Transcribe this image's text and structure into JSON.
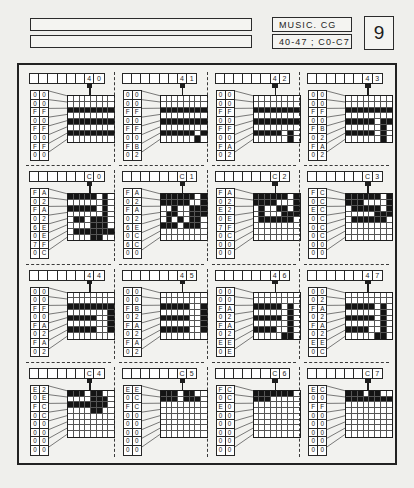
{
  "header": {
    "blank_field_1": "",
    "blank_field_2": "",
    "title": "MUSIC. CG",
    "range": "40-47 ; C0-C7",
    "page_number": "9"
  },
  "chart_data": {
    "type": "table",
    "title": "MUSIC. CG",
    "subtitle": "40-47 ; C0-C7",
    "columns": 4,
    "rows": 4,
    "cell_grid_size": "8x8",
    "codes": [
      "40",
      "41",
      "42",
      "43",
      "C0",
      "C1",
      "C2",
      "C3",
      "44",
      "45",
      "46",
      "47",
      "C4",
      "C5",
      "C6",
      "C7"
    ]
  },
  "cells": [
    {
      "code_hi": "4",
      "code_lo": "0",
      "bytes": [
        "00",
        "00",
        "FF",
        "00",
        "FF",
        "00",
        "FF",
        "00"
      ],
      "rows": [
        [
          0,
          0,
          0,
          0,
          0,
          0,
          0,
          0
        ],
        [
          0,
          0,
          0,
          0,
          0,
          0,
          0,
          0
        ],
        [
          1,
          1,
          1,
          1,
          1,
          1,
          1,
          1
        ],
        [
          0,
          0,
          0,
          0,
          0,
          0,
          0,
          0
        ],
        [
          1,
          1,
          1,
          1,
          1,
          1,
          1,
          1
        ],
        [
          0,
          0,
          0,
          0,
          0,
          0,
          0,
          0
        ],
        [
          1,
          1,
          1,
          1,
          1,
          1,
          1,
          1
        ],
        [
          0,
          0,
          0,
          0,
          0,
          0,
          0,
          0
        ]
      ]
    },
    {
      "code_hi": "4",
      "code_lo": "1",
      "bytes": [
        "00",
        "00",
        "FF",
        "00",
        "FF",
        "00",
        "FB",
        "02"
      ],
      "rows": [
        [
          0,
          0,
          0,
          0,
          0,
          0,
          0,
          0
        ],
        [
          0,
          0,
          0,
          0,
          0,
          0,
          0,
          0
        ],
        [
          1,
          1,
          1,
          1,
          1,
          1,
          1,
          1
        ],
        [
          0,
          0,
          0,
          0,
          0,
          0,
          0,
          0
        ],
        [
          1,
          1,
          1,
          1,
          1,
          1,
          1,
          1
        ],
        [
          0,
          0,
          0,
          0,
          0,
          0,
          0,
          0
        ],
        [
          1,
          1,
          1,
          1,
          1,
          1,
          0,
          1
        ],
        [
          0,
          0,
          0,
          0,
          0,
          0,
          1,
          0
        ]
      ]
    },
    {
      "code_hi": "4",
      "code_lo": "2",
      "bytes": [
        "00",
        "00",
        "FF",
        "00",
        "FF",
        "00",
        "FA",
        "02"
      ],
      "rows": [
        [
          0,
          0,
          0,
          0,
          0,
          0,
          0,
          0
        ],
        [
          0,
          0,
          0,
          0,
          0,
          0,
          0,
          0
        ],
        [
          1,
          1,
          1,
          1,
          1,
          1,
          1,
          1
        ],
        [
          0,
          0,
          0,
          0,
          0,
          0,
          0,
          0
        ],
        [
          1,
          1,
          1,
          1,
          1,
          1,
          1,
          1
        ],
        [
          0,
          0,
          0,
          0,
          0,
          0,
          0,
          0
        ],
        [
          1,
          1,
          1,
          1,
          1,
          0,
          1,
          0
        ],
        [
          0,
          0,
          0,
          0,
          0,
          0,
          1,
          0
        ]
      ]
    },
    {
      "code_hi": "4",
      "code_lo": "3",
      "bytes": [
        "00",
        "00",
        "FF",
        "00",
        "FB",
        "02",
        "FA",
        "02"
      ],
      "rows": [
        [
          0,
          0,
          0,
          0,
          0,
          0,
          0,
          0
        ],
        [
          0,
          0,
          0,
          0,
          0,
          0,
          0,
          0
        ],
        [
          1,
          1,
          1,
          1,
          1,
          1,
          1,
          1
        ],
        [
          0,
          0,
          0,
          0,
          0,
          0,
          0,
          0
        ],
        [
          1,
          1,
          1,
          1,
          1,
          0,
          1,
          1
        ],
        [
          0,
          0,
          0,
          0,
          0,
          0,
          1,
          0
        ],
        [
          1,
          1,
          1,
          1,
          1,
          0,
          1,
          0
        ],
        [
          0,
          0,
          0,
          0,
          0,
          0,
          1,
          0
        ]
      ]
    },
    {
      "code_hi": "C",
      "code_lo": "0",
      "bytes": [
        "FA",
        "02",
        "FA",
        "02",
        "6E",
        "0E",
        "7F",
        "0C"
      ],
      "rows": [
        [
          1,
          1,
          1,
          1,
          1,
          0,
          1,
          0
        ],
        [
          0,
          0,
          0,
          0,
          0,
          0,
          1,
          0
        ],
        [
          1,
          1,
          1,
          1,
          1,
          0,
          1,
          0
        ],
        [
          0,
          0,
          0,
          0,
          0,
          0,
          1,
          0
        ],
        [
          0,
          1,
          1,
          0,
          1,
          1,
          1,
          0
        ],
        [
          0,
          0,
          0,
          0,
          1,
          1,
          1,
          0
        ],
        [
          0,
          1,
          1,
          1,
          1,
          1,
          1,
          1
        ],
        [
          0,
          0,
          0,
          0,
          1,
          1,
          0,
          0
        ]
      ]
    },
    {
      "code_hi": "C",
      "code_lo": "1",
      "bytes": [
        "FA",
        "02",
        "FA",
        "02",
        "6E",
        "0C",
        "6C",
        "00"
      ],
      "rows": [
        [
          1,
          1,
          1,
          1,
          1,
          1,
          0,
          1
        ],
        [
          1,
          1,
          1,
          1,
          1,
          0,
          0,
          1
        ],
        [
          0,
          0,
          1,
          0,
          0,
          1,
          1,
          1
        ],
        [
          0,
          1,
          1,
          0,
          0,
          1,
          1,
          1
        ],
        [
          0,
          1,
          0,
          1,
          0,
          1,
          1,
          0
        ],
        [
          1,
          1,
          1,
          0,
          1,
          1,
          1,
          0
        ],
        [
          0,
          0,
          0,
          0,
          0,
          0,
          0,
          0
        ],
        [
          0,
          0,
          0,
          0,
          0,
          0,
          0,
          0
        ]
      ]
    },
    {
      "code_hi": "C",
      "code_lo": "2",
      "bytes": [
        "FA",
        "02",
        "E2",
        "0E",
        "7F",
        "0C",
        "00",
        "00"
      ],
      "rows": [
        [
          1,
          1,
          1,
          1,
          1,
          1,
          0,
          1
        ],
        [
          1,
          1,
          1,
          1,
          0,
          0,
          0,
          1
        ],
        [
          0,
          1,
          0,
          0,
          1,
          1,
          0,
          1
        ],
        [
          0,
          1,
          0,
          0,
          0,
          1,
          1,
          1
        ],
        [
          0,
          1,
          1,
          1,
          1,
          1,
          1,
          0
        ],
        [
          0,
          0,
          0,
          0,
          0,
          0,
          0,
          0
        ],
        [
          0,
          0,
          0,
          0,
          0,
          0,
          0,
          0
        ],
        [
          0,
          0,
          0,
          0,
          0,
          0,
          0,
          0
        ]
      ]
    },
    {
      "code_hi": "C",
      "code_lo": "3",
      "bytes": [
        "FC",
        "0C",
        "EC",
        "0C",
        "0C",
        "0C",
        "00",
        "00"
      ],
      "rows": [
        [
          1,
          1,
          1,
          1,
          1,
          1,
          0,
          1
        ],
        [
          1,
          1,
          1,
          0,
          0,
          0,
          0,
          1
        ],
        [
          0,
          1,
          1,
          1,
          1,
          1,
          0,
          1
        ],
        [
          0,
          0,
          0,
          0,
          0,
          1,
          1,
          1
        ],
        [
          0,
          1,
          1,
          1,
          1,
          1,
          1,
          0
        ],
        [
          0,
          0,
          0,
          0,
          0,
          0,
          0,
          0
        ],
        [
          0,
          0,
          0,
          0,
          0,
          0,
          0,
          0
        ],
        [
          0,
          0,
          0,
          0,
          0,
          0,
          0,
          0
        ]
      ]
    },
    {
      "code_hi": "4",
      "code_lo": "4",
      "bytes": [
        "00",
        "00",
        "FF",
        "00",
        "FA",
        "02",
        "FA",
        "02"
      ],
      "rows": [
        [
          0,
          0,
          0,
          0,
          0,
          0,
          0,
          0
        ],
        [
          0,
          0,
          0,
          0,
          0,
          0,
          0,
          0
        ],
        [
          1,
          1,
          1,
          1,
          1,
          1,
          1,
          1
        ],
        [
          0,
          0,
          0,
          0,
          0,
          0,
          0,
          1
        ],
        [
          1,
          1,
          1,
          1,
          1,
          0,
          0,
          1
        ],
        [
          0,
          0,
          0,
          0,
          0,
          0,
          0,
          1
        ],
        [
          1,
          1,
          1,
          1,
          1,
          0,
          0,
          1
        ],
        [
          0,
          0,
          0,
          0,
          0,
          0,
          0,
          0
        ]
      ]
    },
    {
      "code_hi": "4",
      "code_lo": "5",
      "bytes": [
        "00",
        "00",
        "FB",
        "02",
        "FA",
        "02",
        "FA",
        "02"
      ],
      "rows": [
        [
          0,
          0,
          0,
          0,
          0,
          0,
          0,
          0
        ],
        [
          0,
          0,
          0,
          0,
          0,
          0,
          0,
          0
        ],
        [
          1,
          1,
          1,
          1,
          1,
          0,
          0,
          1
        ],
        [
          0,
          0,
          0,
          0,
          0,
          0,
          0,
          1
        ],
        [
          1,
          1,
          1,
          1,
          1,
          0,
          0,
          1
        ],
        [
          0,
          0,
          0,
          0,
          0,
          0,
          0,
          1
        ],
        [
          1,
          1,
          1,
          1,
          1,
          0,
          0,
          1
        ],
        [
          0,
          0,
          0,
          0,
          0,
          0,
          0,
          0
        ]
      ]
    },
    {
      "code_hi": "4",
      "code_lo": "6",
      "bytes": [
        "00",
        "00",
        "FA",
        "02",
        "FA",
        "02",
        "EE",
        "0E"
      ],
      "rows": [
        [
          0,
          0,
          0,
          0,
          0,
          0,
          0,
          0
        ],
        [
          0,
          0,
          0,
          0,
          0,
          0,
          0,
          0
        ],
        [
          1,
          1,
          1,
          1,
          1,
          0,
          1,
          0
        ],
        [
          0,
          0,
          0,
          0,
          0,
          0,
          1,
          0
        ],
        [
          1,
          1,
          1,
          1,
          1,
          0,
          1,
          0
        ],
        [
          0,
          0,
          0,
          0,
          0,
          0,
          1,
          0
        ],
        [
          1,
          1,
          1,
          1,
          0,
          0,
          1,
          0
        ],
        [
          0,
          0,
          0,
          0,
          0,
          1,
          1,
          0
        ]
      ]
    },
    {
      "code_hi": "4",
      "code_lo": "7",
      "bytes": [
        "00",
        "02",
        "FA",
        "02",
        "FA",
        "02",
        "EE",
        "0C"
      ],
      "rows": [
        [
          0,
          0,
          0,
          0,
          0,
          0,
          0,
          0
        ],
        [
          0,
          0,
          0,
          0,
          0,
          0,
          0,
          0
        ],
        [
          1,
          1,
          1,
          1,
          1,
          0,
          1,
          0
        ],
        [
          0,
          0,
          0,
          0,
          0,
          0,
          1,
          0
        ],
        [
          1,
          1,
          1,
          1,
          1,
          0,
          1,
          0
        ],
        [
          0,
          0,
          0,
          0,
          0,
          0,
          1,
          0
        ],
        [
          1,
          1,
          1,
          1,
          0,
          0,
          1,
          0
        ],
        [
          0,
          0,
          0,
          0,
          0,
          1,
          1,
          0
        ]
      ]
    },
    {
      "code_hi": "C",
      "code_lo": "4",
      "bytes": [
        "E2",
        "0E",
        "FC",
        "0C",
        "00",
        "00",
        "00",
        "00"
      ],
      "rows": [
        [
          1,
          1,
          1,
          0,
          1,
          1,
          0,
          0
        ],
        [
          0,
          0,
          0,
          0,
          1,
          1,
          1,
          0
        ],
        [
          1,
          1,
          1,
          1,
          1,
          1,
          1,
          0
        ],
        [
          0,
          0,
          0,
          0,
          1,
          1,
          0,
          0
        ],
        [
          0,
          0,
          0,
          0,
          0,
          0,
          0,
          0
        ],
        [
          0,
          0,
          0,
          0,
          0,
          0,
          0,
          0
        ],
        [
          0,
          0,
          0,
          0,
          0,
          0,
          0,
          0
        ],
        [
          0,
          0,
          0,
          0,
          0,
          0,
          0,
          0
        ]
      ]
    },
    {
      "code_hi": "C",
      "code_lo": "5",
      "bytes": [
        "EE",
        "0C",
        "FC",
        "00",
        "00",
        "00",
        "00",
        "00"
      ],
      "rows": [
        [
          1,
          1,
          1,
          0,
          1,
          1,
          0,
          0
        ],
        [
          1,
          1,
          1,
          0,
          1,
          1,
          1,
          0
        ],
        [
          0,
          0,
          0,
          0,
          0,
          0,
          0,
          0
        ],
        [
          0,
          0,
          0,
          0,
          0,
          0,
          0,
          0
        ],
        [
          0,
          0,
          0,
          0,
          0,
          0,
          0,
          0
        ],
        [
          0,
          0,
          0,
          0,
          0,
          0,
          0,
          0
        ],
        [
          0,
          0,
          0,
          0,
          0,
          0,
          0,
          0
        ],
        [
          0,
          0,
          0,
          0,
          0,
          0,
          0,
          0
        ]
      ]
    },
    {
      "code_hi": "C",
      "code_lo": "6",
      "bytes": [
        "FC",
        "0C",
        "E0",
        "00",
        "00",
        "00",
        "00",
        "00"
      ],
      "rows": [
        [
          1,
          1,
          1,
          1,
          1,
          1,
          1,
          0
        ],
        [
          1,
          1,
          1,
          0,
          0,
          0,
          0,
          0
        ],
        [
          0,
          0,
          0,
          0,
          0,
          0,
          0,
          0
        ],
        [
          0,
          0,
          0,
          0,
          0,
          0,
          0,
          0
        ],
        [
          0,
          0,
          0,
          0,
          0,
          0,
          0,
          0
        ],
        [
          0,
          0,
          0,
          0,
          0,
          0,
          0,
          0
        ],
        [
          0,
          0,
          0,
          0,
          0,
          0,
          0,
          0
        ],
        [
          0,
          0,
          0,
          0,
          0,
          0,
          0,
          0
        ]
      ]
    },
    {
      "code_hi": "C",
      "code_lo": "7",
      "bytes": [
        "EC",
        "00",
        "FF",
        "00",
        "00",
        "00",
        "00",
        "00"
      ],
      "rows": [
        [
          1,
          1,
          1,
          0,
          1,
          1,
          0,
          0
        ],
        [
          1,
          1,
          1,
          1,
          1,
          1,
          1,
          1
        ],
        [
          0,
          0,
          0,
          0,
          0,
          0,
          0,
          0
        ],
        [
          0,
          0,
          0,
          0,
          0,
          0,
          0,
          0
        ],
        [
          0,
          0,
          0,
          0,
          0,
          0,
          0,
          0
        ],
        [
          0,
          0,
          0,
          0,
          0,
          0,
          0,
          0
        ],
        [
          0,
          0,
          0,
          0,
          0,
          0,
          0,
          0
        ],
        [
          0,
          0,
          0,
          0,
          0,
          0,
          0,
          0
        ]
      ]
    }
  ]
}
